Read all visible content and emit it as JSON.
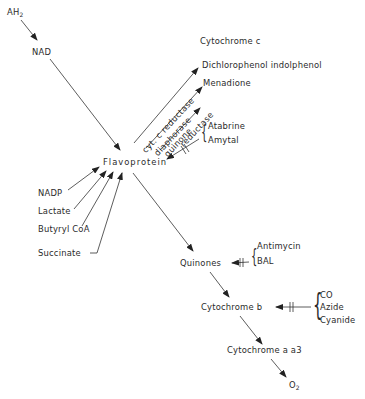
{
  "diagram": {
    "nodes": {
      "ah2": {
        "label": "AH",
        "sub": "2"
      },
      "nad": {
        "label": "NAD"
      },
      "flavoprotein": {
        "label": "Flavoprotein"
      },
      "cytochrome_c": {
        "label": "Cytochrome c"
      },
      "dcip": {
        "label": "Dichlorophenol indolphenol"
      },
      "menadione": {
        "label": "Menadione"
      },
      "nadp": {
        "label": "NADP"
      },
      "lactate": {
        "label": "Lactate"
      },
      "butyryl_coa": {
        "label": "Butyryl CoA"
      },
      "succinate": {
        "label": "Succinate"
      },
      "quinones": {
        "label": "Quinones"
      },
      "cytochrome_b": {
        "label": "Cytochrome b"
      },
      "cytochrome_aa3": {
        "label": "Cytochrome a a3"
      },
      "o2": {
        "label": "O",
        "sub": "2"
      }
    },
    "enzymes": {
      "cyt_c_reductase": "cyt. c reductase",
      "diaphorase": "diaphorase",
      "quinone_reductase_1": "quinone",
      "quinone_reductase_2": "reductase"
    },
    "inhibitors": {
      "flavoprotein_group": [
        "Atabrine",
        "Amytal"
      ],
      "quinones_group": [
        "Antimycin",
        "BAL"
      ],
      "cytochrome_b_group": [
        "CO",
        "Azide",
        "Cyanide"
      ]
    },
    "edges": [
      {
        "from": "AH2",
        "to": "NAD"
      },
      {
        "from": "NAD",
        "to": "Flavoprotein"
      },
      {
        "from": "Flavoprotein",
        "to": "Cytochrome c",
        "via": "cyt. c reductase"
      },
      {
        "from": "Flavoprotein",
        "to": "Dichlorophenol indolphenol",
        "via": "diaphorase"
      },
      {
        "from": "Flavoprotein",
        "to": "Menadione",
        "via": "quinone reductase"
      },
      {
        "from": "NADP",
        "to": "Flavoprotein"
      },
      {
        "from": "Lactate",
        "to": "Flavoprotein"
      },
      {
        "from": "Butyryl CoA",
        "to": "Flavoprotein"
      },
      {
        "from": "Succinate",
        "to": "Flavoprotein"
      },
      {
        "from": "Flavoprotein",
        "to": "Quinones"
      },
      {
        "from": "Quinones",
        "to": "Cytochrome b"
      },
      {
        "from": "Cytochrome b",
        "to": "Cytochrome a a3"
      },
      {
        "from": "Cytochrome a a3",
        "to": "O2"
      }
    ],
    "colors": {
      "line": "#333333",
      "text": "#2a2a2a",
      "background": "#ffffff"
    }
  }
}
